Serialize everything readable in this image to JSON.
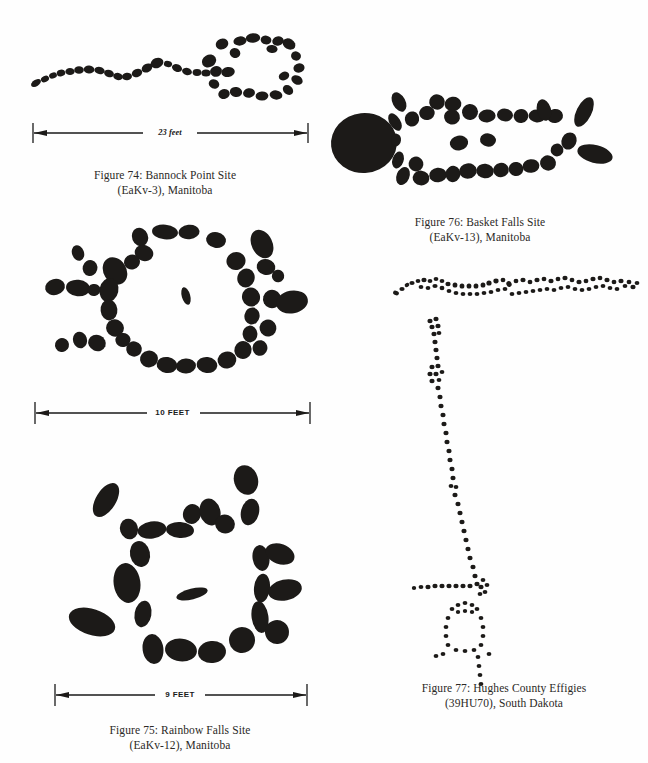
{
  "page": {
    "background": "#fefefe",
    "ink": "#1c1a18",
    "width": 648,
    "height": 763
  },
  "figures": [
    {
      "id": "figure-74",
      "number": "Figure 74",
      "caption_line1": "Figure 74: Bannock Point Site",
      "caption_line2": "(EaKv-3), Manitoba",
      "site_name": "Bannock Point Site",
      "borden_code": "EaKv-3",
      "region": "Manitoba",
      "scale_label": "23 feet",
      "scale_value": 23,
      "scale_unit": "feet",
      "elements": [
        "serpentine-stone-alignment",
        "stone-circle"
      ]
    },
    {
      "id": "figure-76",
      "number": "Figure 76",
      "caption_line1": "Figure 76: Basket Falls Site",
      "caption_line2": "(EaKv-13), Manitoba",
      "site_name": "Basket Falls Site",
      "borden_code": "EaKv-13",
      "region": "Manitoba",
      "scale_label": "",
      "elements": [
        "turtle-effigy-boulder-outline"
      ]
    },
    {
      "id": "figure-75",
      "number": "Figure 75",
      "caption_line1": "Figure 75: Rainbow Falls Site",
      "caption_line2": "(EaKv-12), Manitoba",
      "site_name": "Rainbow Falls Site",
      "borden_code": "EaKv-12",
      "region": "Manitoba",
      "scale_label": "9 FEET",
      "scale_value": 9,
      "scale_unit": "FEET",
      "elements": [
        "stone-circle-with-rays"
      ]
    },
    {
      "id": "figure-75-upper",
      "number": "",
      "scale_label": "10 FEET",
      "scale_value": 10,
      "scale_unit": "FEET",
      "elements": [
        "radiating-stone-circle"
      ]
    },
    {
      "id": "figure-77",
      "number": "Figure 77",
      "caption_line1": "Figure 77: Hughes County Effigies",
      "caption_line2": "(39HU70), South Dakota",
      "site_name": "Hughes County Effigies",
      "site_code": "39HU70",
      "region": "South Dakota",
      "scale_label": "",
      "elements": [
        "serpent-effigy",
        "long-line-effigy",
        "human-figure-effigy"
      ]
    }
  ]
}
